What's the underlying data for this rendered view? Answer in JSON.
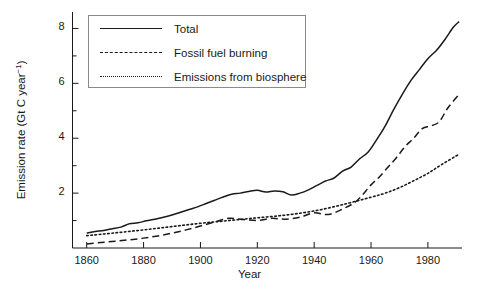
{
  "chart_data": {
    "type": "line",
    "title": "",
    "xlabel": "Year",
    "ylabel": "Emission rate (Gt C year-1)",
    "ylabel_base": "Emission rate (Gt C year",
    "ylabel_sup": "−1",
    "ylabel_close": ")",
    "xlim": [
      1855,
      1992
    ],
    "ylim": [
      0,
      8.6
    ],
    "xticks": [
      1860,
      1880,
      1900,
      1920,
      1940,
      1960,
      1980
    ],
    "xtick_labels": [
      "1860",
      "1880",
      "1900",
      "1920",
      "1940",
      "1960",
      "1980"
    ],
    "yticks": [
      2,
      4,
      6,
      8
    ],
    "ytick_labels": [
      "2",
      "4",
      "6",
      "8"
    ],
    "yminor_ticks": [
      1,
      3,
      5,
      7
    ],
    "grid": false,
    "legend_position": "upper-left-inside",
    "series": [
      {
        "name": "Total",
        "style": "solid",
        "color": "#1a1a1a",
        "x": [
          1860,
          1863,
          1866,
          1869,
          1872,
          1875,
          1878,
          1881,
          1884,
          1887,
          1890,
          1893,
          1896,
          1899,
          1902,
          1905,
          1908,
          1911,
          1914,
          1917,
          1920,
          1923,
          1926,
          1929,
          1932,
          1935,
          1938,
          1941,
          1944,
          1947,
          1950,
          1953,
          1956,
          1959,
          1962,
          1965,
          1968,
          1971,
          1974,
          1977,
          1980,
          1983,
          1986,
          1989,
          1991
        ],
        "values": [
          0.55,
          0.6,
          0.64,
          0.7,
          0.76,
          0.88,
          0.92,
          0.99,
          1.05,
          1.12,
          1.2,
          1.3,
          1.4,
          1.5,
          1.62,
          1.74,
          1.86,
          1.96,
          2.0,
          2.06,
          2.1,
          2.04,
          2.08,
          2.05,
          1.93,
          2.0,
          2.12,
          2.28,
          2.44,
          2.55,
          2.8,
          2.95,
          3.25,
          3.5,
          3.95,
          4.45,
          5.05,
          5.6,
          6.1,
          6.5,
          6.9,
          7.2,
          7.6,
          8.05,
          8.25
        ]
      },
      {
        "name": "Fossil fuel burning",
        "style": "dashed",
        "color": "#1a1a1a",
        "x": [
          1860,
          1865,
          1870,
          1875,
          1880,
          1885,
          1890,
          1895,
          1900,
          1905,
          1910,
          1915,
          1920,
          1925,
          1930,
          1935,
          1940,
          1945,
          1950,
          1955,
          1960,
          1963,
          1966,
          1969,
          1972,
          1975,
          1978,
          1981,
          1984,
          1987,
          1991
        ],
        "values": [
          0.15,
          0.2,
          0.25,
          0.3,
          0.36,
          0.44,
          0.54,
          0.66,
          0.8,
          0.95,
          1.08,
          1.04,
          1.0,
          1.08,
          1.05,
          1.12,
          1.28,
          1.22,
          1.42,
          1.72,
          2.3,
          2.6,
          2.95,
          3.3,
          3.7,
          4.0,
          4.35,
          4.45,
          4.6,
          5.1,
          5.6
        ]
      },
      {
        "name": "Emissions from biosphere",
        "style": "dotted",
        "color": "#1a1a1a",
        "x": [
          1860,
          1870,
          1880,
          1890,
          1900,
          1910,
          1920,
          1930,
          1940,
          1950,
          1960,
          1965,
          1970,
          1975,
          1980,
          1985,
          1991
        ],
        "values": [
          0.45,
          0.55,
          0.66,
          0.78,
          0.9,
          1.0,
          1.1,
          1.2,
          1.35,
          1.58,
          1.85,
          2.0,
          2.2,
          2.45,
          2.72,
          3.05,
          3.42
        ]
      }
    ]
  },
  "legend": {
    "items": [
      {
        "label": "Total",
        "style": "solid"
      },
      {
        "label": "Fossil fuel burning",
        "style": "dashed"
      },
      {
        "label": "Emissions from biosphere",
        "style": "dotted"
      }
    ]
  }
}
